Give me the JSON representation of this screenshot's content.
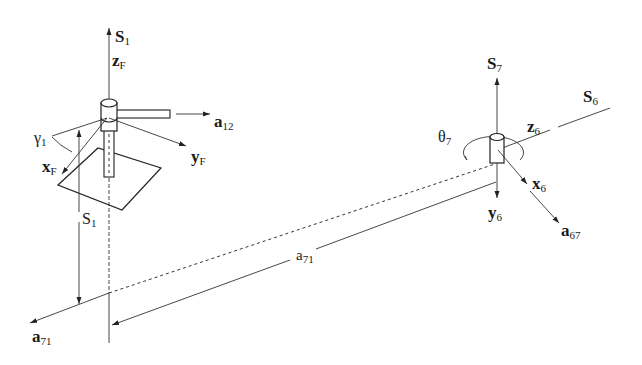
{
  "diagram": {
    "type": "spatial mechanism kinematic sketch",
    "labels": {
      "s1_top": {
        "main": "S",
        "sub": "1"
      },
      "zF": {
        "main": "z",
        "sub": "F"
      },
      "a12": {
        "main": "a",
        "sub": "12"
      },
      "gamma1": {
        "main": "γ",
        "sub": "1"
      },
      "xF": {
        "main": "x",
        "sub": "F"
      },
      "yF": {
        "main": "y",
        "sub": "F"
      },
      "s1_dim": {
        "main": "S",
        "sub": "1"
      },
      "a71_axis": {
        "main": "a",
        "sub": "71"
      },
      "a71_dim": {
        "main": "a",
        "sub": "71"
      },
      "s7": {
        "main": "S",
        "sub": "7"
      },
      "s6": {
        "main": "S",
        "sub": "6"
      },
      "z6": {
        "main": "z",
        "sub": "6"
      },
      "theta7": {
        "main": "θ",
        "sub": "7"
      },
      "x6": {
        "main": "x",
        "sub": "6"
      },
      "y6": {
        "main": "y",
        "sub": "6"
      },
      "a67": {
        "main": "a",
        "sub": "67"
      }
    },
    "colors": {
      "stroke": "#222222",
      "background": "#ffffff"
    }
  }
}
